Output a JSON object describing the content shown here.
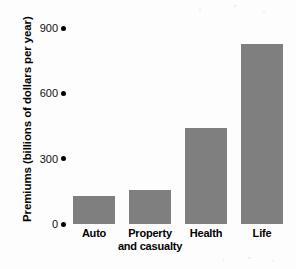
{
  "chart_data": {
    "type": "bar",
    "title": "",
    "subtitle": "",
    "xlabel": "",
    "ylabel": "Premiums (billions of dollars per year)",
    "categories": [
      "Auto",
      "Property and casualty",
      "Health",
      "Life"
    ],
    "category_lines": [
      [
        "Auto"
      ],
      [
        "Property",
        "and casualty"
      ],
      [
        "Health"
      ],
      [
        "Life"
      ]
    ],
    "values": [
      130,
      155,
      440,
      825
    ],
    "ylim": [
      0,
      900
    ],
    "yticks": [
      0,
      300,
      600,
      900
    ],
    "ytick_labels": [
      "0",
      "300",
      "600",
      "900"
    ],
    "grid": false,
    "legend": null,
    "bar_color": "#7f7f7f",
    "text_color": "#000000",
    "background_color": "#ffffff",
    "tick_marker": "filled-dot"
  }
}
